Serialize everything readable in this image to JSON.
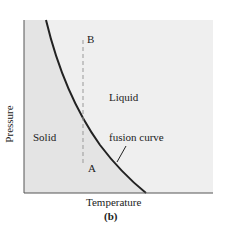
{
  "diagram": {
    "type": "phase-diagram",
    "panel_label": "(b)",
    "axes": {
      "x_label": "Temperature",
      "y_label": "Pressure"
    },
    "regions": [
      {
        "name": "solid",
        "label": "Solid",
        "fill": "#e4e4e4"
      },
      {
        "name": "liquid",
        "label": "Liquid",
        "fill": "#efefef"
      }
    ],
    "curve": {
      "label": "fusion curve",
      "color": "#222222"
    },
    "points": [
      {
        "id": "A",
        "label": "A"
      },
      {
        "id": "B",
        "label": "B"
      }
    ],
    "dashed_path": "A to B (vertical, constant temperature)"
  }
}
